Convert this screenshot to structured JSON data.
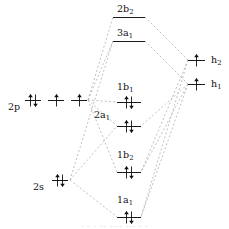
{
  "diagram": {
    "type": "mo-correlation-diagram",
    "line_color": "#111111",
    "correlation_line_color": "#b0b0b0",
    "correlation_line_style": "dashed",
    "background": "#ffffff"
  },
  "left_fragment": {
    "name": "oxygen-atomic-orbitals",
    "levels": [
      {
        "id": "2p",
        "label": "2p",
        "label_x": 8,
        "label_y": 102,
        "y": 100,
        "orbitals": [
          {
            "x": 25,
            "width": 16,
            "electrons": 2
          },
          {
            "x": 48,
            "width": 16,
            "electrons": 1
          },
          {
            "x": 71,
            "width": 16,
            "electrons": 1
          }
        ]
      },
      {
        "id": "2s",
        "label": "2s",
        "label_x": 33,
        "label_y": 182,
        "y": 180,
        "orbitals": [
          {
            "x": 52,
            "width": 16,
            "electrons": 2
          }
        ]
      }
    ]
  },
  "right_fragment": {
    "name": "hydrogen-group-orbitals",
    "levels": [
      {
        "id": "h2",
        "label": "h",
        "sub": "2",
        "y": 60,
        "x": 188,
        "width": 17,
        "electrons": 1,
        "label_x": 211,
        "label_y": 55
      },
      {
        "id": "h1",
        "label": "h",
        "sub": "1",
        "y": 84,
        "x": 188,
        "width": 17,
        "electrons": 1,
        "label_x": 211,
        "label_y": 79
      }
    ]
  },
  "molecular_orbitals": [
    {
      "id": "2b2",
      "label": "2b",
      "sub": "2",
      "y": 17,
      "x": 113,
      "width": 32,
      "electrons": 0,
      "label_x": 117,
      "label_y": 4,
      "label_align": "above"
    },
    {
      "id": "3a1",
      "label": "3a",
      "sub": "1",
      "y": 41,
      "x": 113,
      "width": 32,
      "electrons": 0,
      "label_x": 117,
      "label_y": 28,
      "label_align": "above"
    },
    {
      "id": "1b1",
      "label": "1b",
      "sub": "1",
      "y": 102,
      "x": 117,
      "width": 24,
      "electrons": 2,
      "label_x": 117,
      "label_y": 82,
      "label_align": "above"
    },
    {
      "id": "2a1",
      "label": "2a",
      "sub": "1",
      "y": 126,
      "x": 117,
      "width": 24,
      "electrons": 2,
      "label_x": 94,
      "label_y": 110,
      "label_align": "left"
    },
    {
      "id": "1b2",
      "label": "1b",
      "sub": "2",
      "y": 172,
      "x": 117,
      "width": 24,
      "electrons": 2,
      "label_x": 117,
      "label_y": 150,
      "label_align": "above"
    },
    {
      "id": "1a1",
      "label": "1a",
      "sub": "1",
      "y": 217,
      "x": 117,
      "width": 24,
      "electrons": 2,
      "label_x": 117,
      "label_y": 195,
      "label_align": "above"
    }
  ],
  "correlation_lines": [
    {
      "from": "2p",
      "to": "2b2",
      "x1": 88,
      "y1": 100,
      "x2": 113,
      "y2": 17
    },
    {
      "from": "2p",
      "to": "3a1",
      "x1": 88,
      "y1": 100,
      "x2": 113,
      "y2": 41
    },
    {
      "from": "2p",
      "to": "1b1",
      "x1": 88,
      "y1": 100,
      "x2": 117,
      "y2": 102
    },
    {
      "from": "2p",
      "to": "2a1",
      "x1": 88,
      "y1": 100,
      "x2": 117,
      "y2": 126
    },
    {
      "from": "2p",
      "to": "1b2",
      "x1": 88,
      "y1": 100,
      "x2": 117,
      "y2": 172
    },
    {
      "from": "2s",
      "to": "3a1",
      "x1": 70,
      "y1": 180,
      "x2": 113,
      "y2": 41
    },
    {
      "from": "2s",
      "to": "2a1",
      "x1": 70,
      "y1": 180,
      "x2": 117,
      "y2": 126
    },
    {
      "from": "2s",
      "to": "1a1",
      "x1": 70,
      "y1": 180,
      "x2": 117,
      "y2": 217
    },
    {
      "from": "h2",
      "to": "2b2",
      "x1": 188,
      "y1": 60,
      "x2": 145,
      "y2": 17
    },
    {
      "from": "h2",
      "to": "1b2",
      "x1": 188,
      "y1": 60,
      "x2": 141,
      "y2": 172
    },
    {
      "from": "h2",
      "to": "1a1",
      "x1": 188,
      "y1": 60,
      "x2": 141,
      "y2": 217
    },
    {
      "from": "h1",
      "to": "3a1",
      "x1": 188,
      "y1": 84,
      "x2": 145,
      "y2": 41
    },
    {
      "from": "h1",
      "to": "2a1",
      "x1": 188,
      "y1": 84,
      "x2": 141,
      "y2": 126
    },
    {
      "from": "h1",
      "to": "1b2",
      "x1": 188,
      "y1": 84,
      "x2": 141,
      "y2": 172
    },
    {
      "from": "h1",
      "to": "1a1",
      "x1": 188,
      "y1": 84,
      "x2": 141,
      "y2": 217
    }
  ],
  "bottom_artifact": {
    "text": "· ·  · ·· ····    ··· · ·",
    "y": 223
  }
}
